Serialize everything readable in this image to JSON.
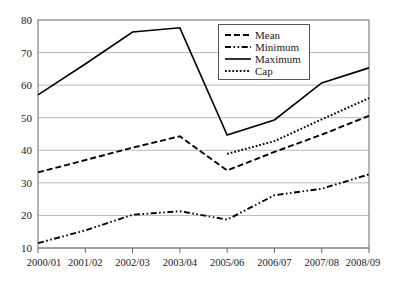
{
  "chart_data": {
    "type": "line",
    "title": "",
    "subtitle": "",
    "xlabel": "",
    "ylabel": "",
    "categories": [
      "2000/01",
      "2001/02",
      "2002/03",
      "2003/04",
      "2005/06",
      "2006/07",
      "2007/08",
      "2008/09"
    ],
    "ylim": [
      10,
      80
    ],
    "yticks": [
      10,
      20,
      30,
      40,
      50,
      60,
      70,
      80
    ],
    "grid": true,
    "legend_position": "top-right",
    "series": [
      {
        "name": "Mean",
        "style": "dashed",
        "values": [
          33.2,
          37.0,
          40.8,
          44.3,
          33.8,
          39.5,
          44.8,
          50.6
        ]
      },
      {
        "name": "Minimum",
        "style": "dash-dot-dot",
        "values": [
          11.5,
          15.4,
          20.2,
          21.3,
          18.7,
          26.2,
          28.2,
          32.6
        ]
      },
      {
        "name": "Maximum",
        "style": "solid",
        "values": [
          57.0,
          66.5,
          76.3,
          77.6,
          44.7,
          49.3,
          60.7,
          65.3
        ]
      },
      {
        "name": "Cap",
        "style": "dotted",
        "values": [
          null,
          null,
          null,
          null,
          38.9,
          42.8,
          49.5,
          56.0
        ]
      }
    ]
  },
  "axis": {
    "y_tick_labels": [
      "80",
      "70",
      "60",
      "50",
      "40",
      "30",
      "20",
      "10"
    ],
    "x_tick_labels": [
      "2000/01",
      "2001/02",
      "2002/03",
      "2003/04",
      "2005/06",
      "2006/07",
      "2007/08",
      "2008/09"
    ]
  },
  "legend": {
    "entries": [
      {
        "label": "Mean"
      },
      {
        "label": "Minimum"
      },
      {
        "label": "Maximum"
      },
      {
        "label": "Cap"
      }
    ]
  },
  "colors": {
    "line": "#000000",
    "grid": "#9a9a9a",
    "axis": "#6b6b6b",
    "text": "#1a1a1a",
    "background": "#ffffff"
  }
}
